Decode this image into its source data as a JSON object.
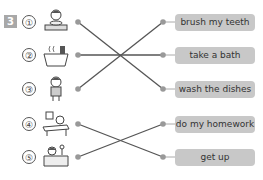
{
  "exercise": {
    "number": "3",
    "items": [
      {
        "marker": "①",
        "picture": "child-eating-at-table"
      },
      {
        "marker": "②",
        "picture": "bathtub-steaming"
      },
      {
        "marker": "③",
        "picture": "child-standing"
      },
      {
        "marker": "④",
        "picture": "child-at-desk"
      },
      {
        "marker": "⑤",
        "picture": "child-in-bed"
      }
    ],
    "labels": [
      "brush my teeth",
      "take a bath",
      "wash the dishes",
      "do my homework",
      "get up"
    ],
    "matches": [
      [
        1,
        3
      ],
      [
        2,
        2
      ],
      [
        3,
        1
      ],
      [
        4,
        5
      ],
      [
        5,
        4
      ]
    ],
    "colors": {
      "badge": "#a8a8a8",
      "pill": "#c8c8c8",
      "line": "#555555",
      "dot": "#999999"
    }
  }
}
